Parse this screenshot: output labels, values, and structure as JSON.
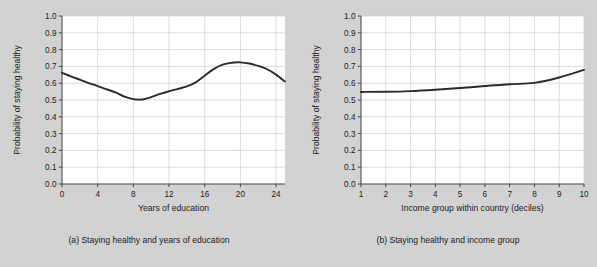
{
  "figure": {
    "background_color": "#d2d2d2",
    "plot_background_color": "#ffffff",
    "grid_color": "#cfcfcf",
    "curve_color": "#2b2b2b",
    "axis_color": "#3a3a3a"
  },
  "panels": [
    {
      "id": "a",
      "caption": "(a) Staying healthy and years of education"
    },
    {
      "id": "b",
      "caption": "(b) Staying healthy and income group"
    }
  ],
  "chart_data": [
    {
      "type": "line",
      "panel": "a",
      "title": "",
      "caption": "(a) Staying healthy and years of education",
      "xlabel": "Years of education",
      "ylabel": "Probability of staying healthy",
      "xlim": [
        0,
        25
      ],
      "ylim": [
        0,
        1
      ],
      "xticks": [
        0,
        4,
        8,
        12,
        16,
        20,
        24
      ],
      "xtick_labels": [
        "0",
        "4",
        "8",
        "12",
        "16",
        "20",
        "24"
      ],
      "yticks": [
        0.0,
        0.1,
        0.2,
        0.3,
        0.4,
        0.5,
        0.6,
        0.7,
        0.8,
        0.9,
        1.0
      ],
      "ytick_labels": [
        "0.0",
        "0.1",
        "0.2",
        "0.3",
        "0.4",
        "0.5",
        "0.6",
        "0.7",
        "0.8",
        "0.9",
        "1.0"
      ],
      "grid": true,
      "legend": false,
      "x": [
        0,
        1,
        2,
        3,
        4,
        5,
        6,
        7,
        8,
        9,
        10,
        11,
        12,
        13,
        14,
        15,
        16,
        17,
        18,
        19,
        20,
        21,
        22,
        23,
        24,
        25
      ],
      "values": [
        0.662,
        0.641,
        0.621,
        0.601,
        0.583,
        0.564,
        0.545,
        0.52,
        0.505,
        0.503,
        0.517,
        0.536,
        0.552,
        0.566,
        0.581,
        0.605,
        0.645,
        0.684,
        0.71,
        0.722,
        0.724,
        0.717,
        0.703,
        0.683,
        0.651,
        0.61
      ]
    },
    {
      "type": "line",
      "panel": "b",
      "title": "",
      "caption": "(b) Staying healthy and income group",
      "xlabel": "Income group within country (deciles)",
      "ylabel": "Probability of staying healthy",
      "xlim": [
        1,
        10
      ],
      "ylim": [
        0,
        1
      ],
      "xticks": [
        1,
        2,
        3,
        4,
        5,
        6,
        7,
        8,
        9,
        10
      ],
      "xtick_labels": [
        "1",
        "2",
        "3",
        "4",
        "5",
        "6",
        "7",
        "8",
        "9",
        "10"
      ],
      "yticks": [
        0.0,
        0.1,
        0.2,
        0.3,
        0.4,
        0.5,
        0.6,
        0.7,
        0.8,
        0.9,
        1.0
      ],
      "ytick_labels": [
        "0.0",
        "0.1",
        "0.2",
        "0.3",
        "0.4",
        "0.5",
        "0.6",
        "0.7",
        "0.8",
        "0.9",
        "1.0"
      ],
      "grid": true,
      "legend": false,
      "x": [
        1,
        2,
        3,
        4,
        5,
        6,
        7,
        8,
        9,
        10
      ],
      "values": [
        0.548,
        0.549,
        0.553,
        0.561,
        0.571,
        0.583,
        0.594,
        0.602,
        0.634,
        0.679
      ]
    }
  ]
}
